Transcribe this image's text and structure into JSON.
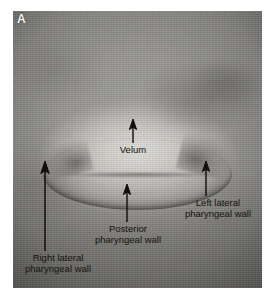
{
  "figure": {
    "panel_label": "A",
    "type": "nasopharyngoscopy-endoscopic-image",
    "modality": "nasopharyngoscopy",
    "view": "velopharyngeal port",
    "background_color": "#ffffff",
    "image_tone": "grayscale"
  },
  "image_frame": {
    "left": 13,
    "top": 11,
    "width": 249,
    "height": 277,
    "base_gray": "#8f8f8f",
    "highlight_gray": "#d7d5d0",
    "shadow_gray": "#2f2d2a"
  },
  "annotations": {
    "arrow_color": "#100f0d",
    "label_color": "#15130f",
    "items": [
      {
        "id": "velum",
        "label_lines": [
          "Velum"
        ],
        "direction": "up",
        "tip": {
          "x": 133,
          "y": 120
        },
        "tail": {
          "x": 133,
          "y": 143
        },
        "label_position": "below-arrow"
      },
      {
        "id": "posterior-pharyngeal-wall",
        "label_lines": [
          "Posterior",
          "pharyngeal wall"
        ],
        "direction": "up",
        "tip": {
          "x": 127,
          "y": 185
        },
        "tail": {
          "x": 127,
          "y": 222
        },
        "label_position": "below-arrow"
      },
      {
        "id": "left-lateral-pharyngeal-wall",
        "label_lines": [
          "Left lateral",
          "pharyngeal wall"
        ],
        "direction": "up",
        "tip": {
          "x": 206,
          "y": 162
        },
        "tail": {
          "x": 206,
          "y": 196
        },
        "label_position": "below-arrow"
      },
      {
        "id": "right-lateral-pharyngeal-wall",
        "label_lines": [
          "Right lateral",
          "pharyngeal wall"
        ],
        "direction": "up",
        "tip": {
          "x": 45,
          "y": 163
        },
        "tail": {
          "x": 45,
          "y": 251
        },
        "label_position": "below-arrow"
      }
    ]
  }
}
